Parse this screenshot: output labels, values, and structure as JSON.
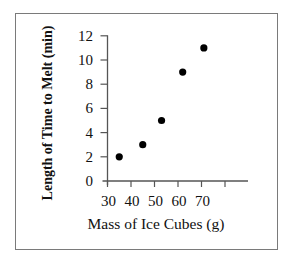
{
  "chart_data": {
    "type": "scatter",
    "title": "",
    "xlabel": "Mass of Ice Cubes (g)",
    "ylabel": "Length of Time to Melt (min)",
    "x_ticks": [
      30,
      40,
      50,
      60,
      70
    ],
    "x_ticks_unlabeled": [
      80
    ],
    "y_ticks": [
      0,
      2,
      4,
      6,
      8,
      10,
      12
    ],
    "xlim": [
      30,
      90
    ],
    "ylim": [
      0,
      12
    ],
    "grid": false,
    "legend": null,
    "series": [
      {
        "name": "Ice cubes",
        "points": [
          {
            "x": 35,
            "y": 2
          },
          {
            "x": 45,
            "y": 3
          },
          {
            "x": 53,
            "y": 5
          },
          {
            "x": 62,
            "y": 9
          },
          {
            "x": 71,
            "y": 11
          }
        ]
      }
    ]
  },
  "labels": {
    "xlabel": "Mass of Ice Cubes (g)",
    "ylabel": "Length of Time to Melt (min)",
    "x_tick_labels": [
      "30",
      "40",
      "50",
      "60",
      "70"
    ],
    "y_tick_labels": [
      "0",
      "2",
      "4",
      "6",
      "8",
      "10",
      "12"
    ]
  }
}
